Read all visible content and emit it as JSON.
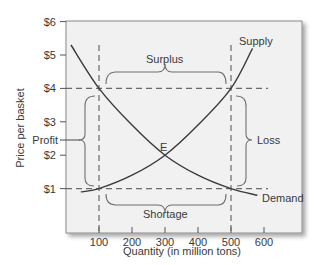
{
  "chart_data": {
    "type": "line",
    "title": "",
    "xlabel": "Quantity (in million tons)",
    "ylabel": "Price per basket",
    "xlim": [
      0,
      720
    ],
    "ylim": [
      0,
      6
    ],
    "x_ticks": [
      100,
      200,
      300,
      400,
      500,
      600
    ],
    "x_tick_labels": [
      "100",
      "200",
      "300",
      "400",
      "500",
      "600"
    ],
    "y_ticks": [
      1,
      2,
      3,
      4,
      5,
      6
    ],
    "y_tick_labels": [
      "$1",
      "$2",
      "$3",
      "$4",
      "$5",
      "$6"
    ],
    "extra_y_tick": {
      "label": "Profit",
      "value": 2.5
    },
    "grid": false,
    "series": [
      {
        "name": "Supply",
        "x": [
          45,
          100,
          200,
          300,
          400,
          500,
          565
        ],
        "y": [
          0.9,
          1.0,
          1.4,
          2.0,
          2.9,
          4.0,
          5.2
        ]
      },
      {
        "name": "Demand",
        "x": [
          15,
          100,
          200,
          300,
          400,
          500,
          580
        ],
        "y": [
          5.3,
          4.0,
          2.9,
          2.0,
          1.4,
          1.0,
          0.8
        ]
      }
    ],
    "reference_lines": [
      {
        "orientation": "vertical",
        "x": 100,
        "style": "dashed"
      },
      {
        "orientation": "vertical",
        "x": 500,
        "style": "dashed"
      },
      {
        "orientation": "horizontal",
        "y": 4,
        "style": "dashed"
      },
      {
        "orientation": "horizontal",
        "y": 1,
        "style": "dashed"
      }
    ],
    "annotations": [
      {
        "text": "Supply",
        "x": 555,
        "y": 5.45
      },
      {
        "text": "Demand",
        "x": 595,
        "y": 0.75
      },
      {
        "text": "E",
        "x": 300,
        "y": 2.2,
        "note": "equilibrium point"
      },
      {
        "text": "Surplus",
        "brace": "horizontal",
        "from_x": 120,
        "to_x": 480,
        "y": 4.3
      },
      {
        "text": "Shortage",
        "brace": "horizontal",
        "from_x": 120,
        "to_x": 480,
        "y": 0.7
      },
      {
        "text": "Profit",
        "brace": "vertical",
        "from_y": 1.05,
        "to_y": 3.8,
        "x": 50
      },
      {
        "text": "Loss",
        "brace": "vertical",
        "from_y": 1.05,
        "to_y": 3.8,
        "x": 540
      }
    ]
  }
}
